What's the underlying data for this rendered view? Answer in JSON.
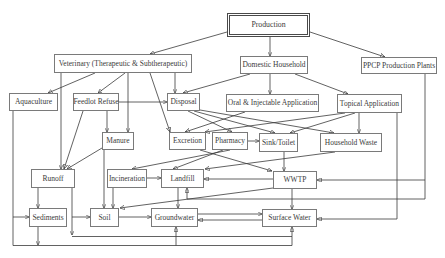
{
  "diagram": {
    "nodes": {
      "production": "Production",
      "veterinary": "Veterinary (Therapeutic & Subtherapeutic)",
      "domestic_household": "Domestic Household",
      "ppcp_plants": "PPCP Production Plants",
      "aquaculture": "Aquaculture",
      "feedlot_refuse": "Feedlot Refuse",
      "disposal": "Disposal",
      "oral_injectable": "Oral & Injectable Application",
      "topical_application": "Topical Application",
      "manure": "Manure",
      "excretion": "Excretion",
      "pharmacy": "Pharmacy",
      "sink_toilet": "Sink/Toilet",
      "household_waste": "Household Waste",
      "runoff": "Runoff",
      "incineration": "Incineration",
      "landfill": "Landfill",
      "wwtp": "WWTP",
      "sediments": "Sediments",
      "soil": "Soil",
      "groundwater": "Groundwater",
      "surface_water": "Surface Water"
    },
    "edges": [
      {
        "from": "production",
        "to": "veterinary"
      },
      {
        "from": "production",
        "to": "domestic_household"
      },
      {
        "from": "production",
        "to": "ppcp_plants"
      },
      {
        "from": "veterinary",
        "to": "aquaculture"
      },
      {
        "from": "veterinary",
        "to": "feedlot_refuse"
      },
      {
        "from": "veterinary",
        "to": "runoff"
      },
      {
        "from": "veterinary",
        "to": "manure"
      },
      {
        "from": "veterinary",
        "to": "excretion"
      },
      {
        "from": "veterinary",
        "to": "disposal"
      },
      {
        "from": "domestic_household",
        "to": "disposal"
      },
      {
        "from": "domestic_household",
        "to": "oral_injectable"
      },
      {
        "from": "domestic_household",
        "to": "topical_application"
      },
      {
        "from": "feedlot_refuse",
        "to": "disposal"
      },
      {
        "from": "feedlot_refuse",
        "to": "manure"
      },
      {
        "from": "feedlot_refuse",
        "to": "runoff"
      },
      {
        "from": "manure",
        "to": "runoff"
      },
      {
        "from": "manure",
        "to": "soil"
      },
      {
        "from": "disposal",
        "to": "pharmacy"
      },
      {
        "from": "disposal",
        "to": "sink_toilet"
      },
      {
        "from": "disposal",
        "to": "household_waste"
      },
      {
        "from": "oral_injectable",
        "to": "excretion"
      },
      {
        "from": "topical_application",
        "to": "excretion"
      },
      {
        "from": "topical_application",
        "to": "sink_toilet"
      },
      {
        "from": "topical_application",
        "to": "household_waste"
      },
      {
        "from": "topical_application",
        "to": "surface_water"
      },
      {
        "from": "pharmacy",
        "to": "sink_toilet"
      },
      {
        "from": "pharmacy",
        "to": "incineration"
      },
      {
        "from": "pharmacy",
        "to": "landfill"
      },
      {
        "from": "excretion",
        "to": "wwtp"
      },
      {
        "from": "sink_toilet",
        "to": "wwtp"
      },
      {
        "from": "household_waste",
        "to": "landfill"
      },
      {
        "from": "incineration",
        "to": "landfill"
      },
      {
        "from": "incineration",
        "to": "soil"
      },
      {
        "from": "wwtp",
        "to": "landfill"
      },
      {
        "from": "wwtp",
        "to": "soil"
      },
      {
        "from": "wwtp",
        "to": "surface_water"
      },
      {
        "from": "ppcp_plants",
        "to": "wwtp"
      },
      {
        "from": "ppcp_plants",
        "to": "landfill"
      },
      {
        "from": "landfill",
        "to": "groundwater"
      },
      {
        "from": "runoff",
        "to": "sediments"
      },
      {
        "from": "runoff",
        "to": "soil"
      },
      {
        "from": "runoff",
        "to": "surface_water"
      },
      {
        "from": "aquaculture",
        "to": "sediments"
      },
      {
        "from": "aquaculture",
        "to": "groundwater"
      },
      {
        "from": "aquaculture",
        "to": "surface_water"
      },
      {
        "from": "sediments",
        "to": "surface_water"
      },
      {
        "from": "soil",
        "to": "groundwater"
      },
      {
        "from": "groundwater",
        "to": "surface_water"
      },
      {
        "from": "surface_water",
        "to": "groundwater"
      }
    ]
  }
}
